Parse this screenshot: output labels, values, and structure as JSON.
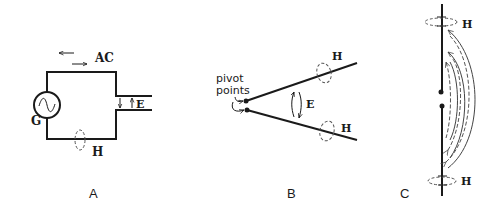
{
  "diagram": {
    "panels": [
      {
        "id": "A",
        "caption": "A",
        "labels": {
          "current": "AC",
          "generator": "G",
          "electric_field": "E",
          "magnetic_field": "H"
        }
      },
      {
        "id": "B",
        "caption": "B",
        "labels": {
          "pivot_line1": "pivot",
          "pivot_line2": "points",
          "electric_field": "E",
          "magnetic_field_upper": "H",
          "magnetic_field_lower": "H"
        }
      },
      {
        "id": "C",
        "caption": "C",
        "labels": {
          "magnetic_field_top": "H",
          "magnetic_field_bottom": "H"
        }
      }
    ],
    "colors": {
      "ink": "#1a1a1a",
      "dashed": "#555555",
      "background": "#ffffff"
    }
  }
}
